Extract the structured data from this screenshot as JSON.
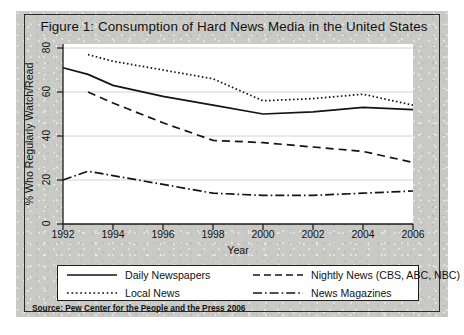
{
  "figure": {
    "title": "Figure 1: Consumption of Hard News Media in the United States",
    "source": "Source: Pew Center for the People and the Press 2006"
  },
  "chart_data": {
    "type": "line",
    "title": "Figure 1: Consumption of Hard News Media in the United States",
    "xlabel": "Year",
    "ylabel": "% Who Regularly Watch/Read",
    "xlim": [
      1992,
      2006
    ],
    "ylim": [
      0,
      80
    ],
    "xticks": [
      1992,
      1994,
      1996,
      1998,
      2000,
      2002,
      2004,
      2006
    ],
    "yticks": [
      0,
      20,
      40,
      60,
      80
    ],
    "xtick_labels": [
      "1992",
      "1994",
      "1996",
      "1998",
      "2000",
      "2002",
      "2004",
      "2006"
    ],
    "ytick_labels": [
      "0",
      "20",
      "40",
      "60",
      "80"
    ],
    "grid": "horizontal",
    "legend_position": "below-axes",
    "series": [
      {
        "name": "Daily Newspapers",
        "style": "solid",
        "x": [
          1992,
          1993,
          1994,
          1996,
          1998,
          2000,
          2002,
          2004,
          2006
        ],
        "values": [
          71,
          68,
          63,
          58,
          54,
          50,
          51,
          53,
          52
        ]
      },
      {
        "name": "Nightly News (CBS, ABC, NBC)",
        "style": "dashed",
        "x": [
          1993,
          1994,
          1996,
          1998,
          2000,
          2002,
          2004,
          2006
        ],
        "values": [
          60,
          55,
          46,
          38,
          37,
          35,
          33,
          28
        ]
      },
      {
        "name": "Local News",
        "style": "dotted",
        "x": [
          1993,
          1994,
          1996,
          1998,
          2000,
          2002,
          2004,
          2006
        ],
        "values": [
          77,
          74,
          70,
          66,
          56,
          57,
          59,
          54
        ]
      },
      {
        "name": "News Magazines",
        "style": "dash-dot",
        "x": [
          1992,
          1993,
          1994,
          1996,
          1998,
          2000,
          2002,
          2004,
          2006
        ],
        "values": [
          20,
          24,
          22,
          18,
          14,
          13,
          13,
          14,
          15
        ]
      }
    ]
  },
  "legend": {
    "items": [
      {
        "label": "Daily Newspapers",
        "style": "solid"
      },
      {
        "label": "Nightly News (CBS, ABC, NBC)",
        "style": "dashed"
      },
      {
        "label": "Local News",
        "style": "dotted"
      },
      {
        "label": "News Magazines",
        "style": "dash-dot"
      }
    ]
  },
  "axes": {
    "y_title": "% Who Regularly Watch/Read",
    "x_title": "Year",
    "y_ticks": [
      "80",
      "60",
      "40",
      "20",
      "0"
    ],
    "x_ticks": [
      "1992",
      "1994",
      "1996",
      "1998",
      "2000",
      "2002",
      "2004",
      "2006"
    ]
  }
}
